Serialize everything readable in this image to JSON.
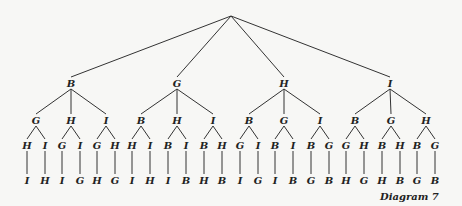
{
  "diagram": {
    "caption": "Diagram 7",
    "root": {
      "label": "",
      "children": [
        {
          "label": "B",
          "children": [
            {
              "label": "G",
              "children": [
                {
                  "label": "H",
                  "children": [
                    {
                      "label": "I"
                    }
                  ]
                },
                {
                  "label": "I",
                  "children": [
                    {
                      "label": "H"
                    }
                  ]
                }
              ]
            },
            {
              "label": "H",
              "children": [
                {
                  "label": "G",
                  "children": [
                    {
                      "label": "I"
                    }
                  ]
                },
                {
                  "label": "I",
                  "children": [
                    {
                      "label": "G"
                    }
                  ]
                }
              ]
            },
            {
              "label": "I",
              "children": [
                {
                  "label": "G",
                  "children": [
                    {
                      "label": "H"
                    }
                  ]
                },
                {
                  "label": "H",
                  "children": [
                    {
                      "label": "G"
                    }
                  ]
                }
              ]
            }
          ]
        },
        {
          "label": "G",
          "children": [
            {
              "label": "B",
              "children": [
                {
                  "label": "H",
                  "children": [
                    {
                      "label": "I"
                    }
                  ]
                },
                {
                  "label": "I",
                  "children": [
                    {
                      "label": "H"
                    }
                  ]
                }
              ]
            },
            {
              "label": "H",
              "children": [
                {
                  "label": "B",
                  "children": [
                    {
                      "label": "I"
                    }
                  ]
                },
                {
                  "label": "I",
                  "children": [
                    {
                      "label": "B"
                    }
                  ]
                }
              ]
            },
            {
              "label": "I",
              "children": [
                {
                  "label": "B",
                  "children": [
                    {
                      "label": "H"
                    }
                  ]
                },
                {
                  "label": "H",
                  "children": [
                    {
                      "label": "B"
                    }
                  ]
                }
              ]
            }
          ]
        },
        {
          "label": "H",
          "children": [
            {
              "label": "B",
              "children": [
                {
                  "label": "G",
                  "children": [
                    {
                      "label": "I"
                    }
                  ]
                },
                {
                  "label": "I",
                  "children": [
                    {
                      "label": "G"
                    }
                  ]
                }
              ]
            },
            {
              "label": "G",
              "children": [
                {
                  "label": "B",
                  "children": [
                    {
                      "label": "I"
                    }
                  ]
                },
                {
                  "label": "I",
                  "children": [
                    {
                      "label": "B"
                    }
                  ]
                }
              ]
            },
            {
              "label": "I",
              "children": [
                {
                  "label": "B",
                  "children": [
                    {
                      "label": "G"
                    }
                  ]
                },
                {
                  "label": "G",
                  "children": [
                    {
                      "label": "B"
                    }
                  ]
                }
              ]
            }
          ]
        },
        {
          "label": "I",
          "children": [
            {
              "label": "B",
              "children": [
                {
                  "label": "G",
                  "children": [
                    {
                      "label": "H"
                    }
                  ]
                },
                {
                  "label": "H",
                  "children": [
                    {
                      "label": "G"
                    }
                  ]
                }
              ]
            },
            {
              "label": "G",
              "children": [
                {
                  "label": "B",
                  "children": [
                    {
                      "label": "H"
                    }
                  ]
                },
                {
                  "label": "H",
                  "children": [
                    {
                      "label": "B"
                    }
                  ]
                }
              ]
            },
            {
              "label": "H",
              "children": [
                {
                  "label": "B",
                  "children": [
                    {
                      "label": "G"
                    }
                  ]
                },
                {
                  "label": "G",
                  "children": [
                    {
                      "label": "B"
                    }
                  ]
                }
              ]
            }
          ]
        }
      ]
    },
    "levels": {
      "level1": [
        "B",
        "G",
        "H",
        "I"
      ],
      "level2": [
        "G",
        "H",
        "I",
        "B",
        "H",
        "I",
        "B",
        "G",
        "I",
        "B",
        "G",
        "H"
      ],
      "level3": [
        "H",
        "I",
        "G",
        "I",
        "G",
        "H",
        "H",
        "I",
        "B",
        "I",
        "B",
        "H",
        "G",
        "I",
        "B",
        "I",
        "B",
        "G",
        "G",
        "H",
        "B",
        "H",
        "B",
        "G"
      ],
      "level4": [
        "I",
        "H",
        "I",
        "G",
        "H",
        "G",
        "I",
        "H",
        "I",
        "B",
        "H",
        "B",
        "I",
        "G",
        "I",
        "B",
        "G",
        "B",
        "H",
        "G",
        "H",
        "B",
        "G",
        "B"
      ]
    }
  }
}
